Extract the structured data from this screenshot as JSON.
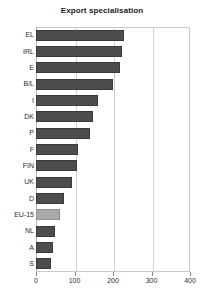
{
  "chart_data": {
    "type": "bar",
    "orientation": "horizontal",
    "title": "Export specialisation",
    "xlabel": "",
    "ylabel": "",
    "xlim": [
      0,
      400
    ],
    "xticks": [
      0,
      100,
      200,
      300,
      400
    ],
    "grid": true,
    "legend": false,
    "highlight_category": "EU-15",
    "colors": {
      "bar": "#4d4d4d",
      "bar_highlight": "#a9a9a9",
      "grid": "#d0d0d0",
      "axis": "#b5b5b5",
      "text": "#2b2b2b"
    },
    "categories": [
      "EL",
      "IRL",
      "E",
      "B/L",
      "I",
      "DK",
      "P",
      "F",
      "FIN",
      "UK",
      "D",
      "EU-15",
      "NL",
      "A",
      "S"
    ],
    "values": [
      229,
      223,
      218,
      200,
      161,
      148,
      140,
      109,
      106,
      94,
      73,
      62,
      50,
      44,
      39
    ]
  }
}
